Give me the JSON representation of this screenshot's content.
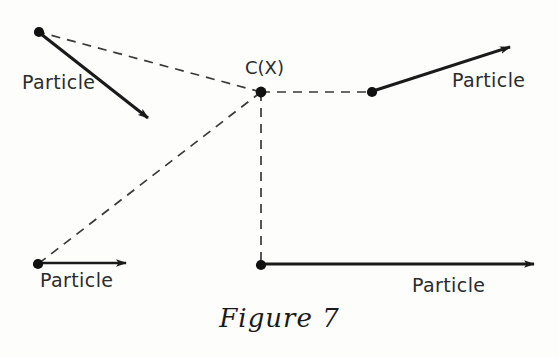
{
  "figure": {
    "caption": "Figure 7",
    "center_label": "C(X)",
    "background_color": "#fdfdfb",
    "stroke_color": "#1a1a1a",
    "dash_color": "#3a3a3a"
  },
  "labels": {
    "particle_top_left": "Particle",
    "particle_bottom_left": "Particle",
    "particle_top_right": "Particle",
    "particle_bottom_right": "Particle"
  },
  "geometry": {
    "center": {
      "x": 261,
      "y": 92
    },
    "particles": [
      {
        "name": "top-left",
        "dot": {
          "x": 39,
          "y": 32
        },
        "arrow_to": {
          "x": 153,
          "y": 122
        },
        "label_pos": {
          "x": 22,
          "y": 72
        }
      },
      {
        "name": "bottom-left",
        "dot": {
          "x": 38,
          "y": 264
        },
        "arrow_to": {
          "x": 132,
          "y": 263
        },
        "label_pos": {
          "x": 40,
          "y": 270
        }
      },
      {
        "name": "top-right",
        "dot": {
          "x": 372,
          "y": 92
        },
        "arrow_to": {
          "x": 516,
          "y": 45
        },
        "label_pos": {
          "x": 452,
          "y": 70
        }
      },
      {
        "name": "bottom-right",
        "dot": {
          "x": 261,
          "y": 265
        },
        "arrow_to": {
          "x": 540,
          "y": 264
        },
        "label_pos": {
          "x": 412,
          "y": 275
        }
      }
    ]
  }
}
